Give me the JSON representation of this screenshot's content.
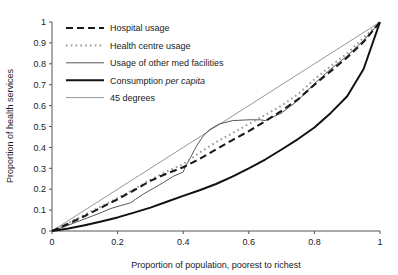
{
  "chart_data": {
    "type": "line",
    "title": "",
    "xlabel": "Proportion of population, poorest to richest",
    "ylabel": "Proportion of health services",
    "xlim": [
      0,
      1
    ],
    "ylim": [
      0,
      1
    ],
    "xticks": [
      "0",
      "0.2",
      "0.4",
      "0.6",
      "0.8",
      "1"
    ],
    "xtick_values": [
      0,
      0.2,
      0.4,
      0.6,
      0.8,
      1
    ],
    "yticks": [
      "0",
      "0.1",
      "0.2",
      "0.3",
      "0.4",
      "0.5",
      "0.6",
      "0.7",
      "0.8",
      "0.9",
      "1"
    ],
    "ytick_values": [
      0,
      0.1,
      0.2,
      0.3,
      0.4,
      0.5,
      0.6,
      0.7,
      0.8,
      0.9,
      1
    ],
    "grid": false,
    "legend_position": "upper-left-inside",
    "series": [
      {
        "name": "Hospital usage",
        "style": "dashed",
        "color": "#1a1a1a",
        "width": 2.1,
        "dash": "7,4",
        "x": [
          0,
          0.05,
          0.1,
          0.15,
          0.2,
          0.25,
          0.3,
          0.35,
          0.4,
          0.45,
          0.5,
          0.55,
          0.6,
          0.65,
          0.7,
          0.75,
          0.8,
          0.85,
          0.9,
          0.95,
          1
        ],
        "y": [
          0,
          0.035,
          0.072,
          0.112,
          0.152,
          0.195,
          0.24,
          0.275,
          0.305,
          0.345,
          0.39,
          0.435,
          0.478,
          0.525,
          0.575,
          0.63,
          0.7,
          0.765,
          0.83,
          0.905,
          1
        ]
      },
      {
        "name": "Health centre usage",
        "style": "dotted",
        "color": "#9a9a9a",
        "width": 2.0,
        "dash": "1.6,3.2",
        "x": [
          0,
          0.05,
          0.1,
          0.15,
          0.2,
          0.25,
          0.3,
          0.35,
          0.4,
          0.45,
          0.5,
          0.55,
          0.6,
          0.65,
          0.7,
          0.75,
          0.8,
          0.85,
          0.9,
          0.95,
          1
        ],
        "y": [
          0,
          0.038,
          0.078,
          0.118,
          0.158,
          0.2,
          0.245,
          0.285,
          0.32,
          0.375,
          0.425,
          0.468,
          0.512,
          0.555,
          0.6,
          0.655,
          0.725,
          0.79,
          0.85,
          0.925,
          1
        ]
      },
      {
        "name": "Usage of other med facilities",
        "style": "solid",
        "color": "#444444",
        "width": 0.9,
        "dash": "",
        "x": [
          0,
          0.04,
          0.09,
          0.14,
          0.18,
          0.21,
          0.24,
          0.255,
          0.28,
          0.31,
          0.34,
          0.37,
          0.385,
          0.4,
          0.405,
          0.42,
          0.44,
          0.46,
          0.48,
          0.51,
          0.55,
          0.6,
          0.635,
          0.65,
          0.7,
          0.75,
          0.8,
          0.85,
          0.9,
          0.95,
          1
        ],
        "y": [
          0,
          0.022,
          0.052,
          0.082,
          0.108,
          0.122,
          0.135,
          0.152,
          0.178,
          0.205,
          0.232,
          0.262,
          0.272,
          0.282,
          0.302,
          0.345,
          0.405,
          0.452,
          0.485,
          0.512,
          0.528,
          0.532,
          0.532,
          0.528,
          0.565,
          0.625,
          0.705,
          0.775,
          0.838,
          0.912,
          1
        ]
      },
      {
        "name": "Consumption per capita",
        "style": "solid",
        "color": "#111111",
        "width": 2.0,
        "dash": "",
        "x": [
          0,
          0.05,
          0.1,
          0.15,
          0.2,
          0.25,
          0.3,
          0.35,
          0.4,
          0.45,
          0.5,
          0.55,
          0.6,
          0.65,
          0.7,
          0.75,
          0.8,
          0.85,
          0.9,
          0.95,
          1
        ],
        "y": [
          0,
          0.012,
          0.028,
          0.045,
          0.065,
          0.088,
          0.112,
          0.14,
          0.168,
          0.195,
          0.225,
          0.26,
          0.3,
          0.342,
          0.39,
          0.44,
          0.495,
          0.565,
          0.645,
          0.775,
          1
        ]
      },
      {
        "name": "45 degrees",
        "style": "solid",
        "color": "#8a8a8a",
        "width": 0.9,
        "dash": "",
        "x": [
          0,
          1
        ],
        "y": [
          0,
          1
        ]
      }
    ],
    "annotations": []
  },
  "legend": {
    "items": [
      {
        "label": "Hospital usage",
        "label_pre": "Hospital usage",
        "label_italic": "",
        "label_post": ""
      },
      {
        "label": "Health centre usage",
        "label_pre": "Health centre usage",
        "label_italic": "",
        "label_post": ""
      },
      {
        "label": "Usage of other med facilities",
        "label_pre": "Usage of other med facilities",
        "label_italic": "",
        "label_post": ""
      },
      {
        "label": "Consumption per capita",
        "label_pre": "Consumption ",
        "label_italic": "per capita",
        "label_post": ""
      },
      {
        "label": "45 degrees",
        "label_pre": "45 degrees",
        "label_italic": "",
        "label_post": ""
      }
    ]
  }
}
